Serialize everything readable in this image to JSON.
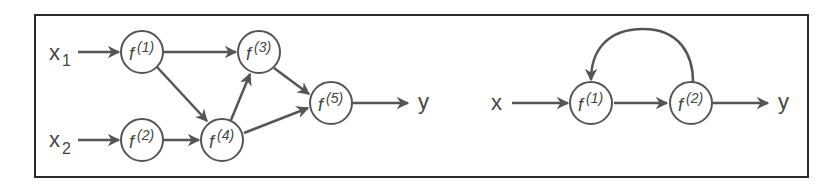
{
  "diagram": {
    "type": "computational-graph",
    "colors": {
      "stroke": "#555555",
      "text": "#444444",
      "frame": "#2a2a2a",
      "background": "#ffffff"
    },
    "left_panel": {
      "title": "feedforward graph",
      "inputs": [
        {
          "id": "x1",
          "base": "x",
          "sub": "1"
        },
        {
          "id": "x2",
          "base": "x",
          "sub": "2"
        }
      ],
      "nodes": [
        {
          "id": "f1",
          "base": "f",
          "sup": "(1)"
        },
        {
          "id": "f2",
          "base": "f",
          "sup": "(2)"
        },
        {
          "id": "f3",
          "base": "f",
          "sup": "(3)"
        },
        {
          "id": "f4",
          "base": "f",
          "sup": "(4)"
        },
        {
          "id": "f5",
          "base": "f",
          "sup": "(5)"
        }
      ],
      "output": {
        "id": "y",
        "label": "y"
      },
      "edges": [
        [
          "x1",
          "f1"
        ],
        [
          "x2",
          "f2"
        ],
        [
          "f1",
          "f3"
        ],
        [
          "f1",
          "f4"
        ],
        [
          "f2",
          "f4"
        ],
        [
          "f4",
          "f3"
        ],
        [
          "f3",
          "f5"
        ],
        [
          "f4",
          "f5"
        ],
        [
          "f5",
          "y"
        ]
      ]
    },
    "right_panel": {
      "title": "recurrent graph",
      "input": {
        "id": "x",
        "label": "x"
      },
      "nodes": [
        {
          "id": "f1",
          "base": "f",
          "sup": "(1)"
        },
        {
          "id": "f2",
          "base": "f",
          "sup": "(2)"
        }
      ],
      "output": {
        "id": "y",
        "label": "y"
      },
      "edges": [
        [
          "x",
          "f1"
        ],
        [
          "f1",
          "f2"
        ],
        [
          "f2",
          "y"
        ],
        [
          "f2",
          "f1",
          "feedback-loop"
        ]
      ]
    }
  }
}
